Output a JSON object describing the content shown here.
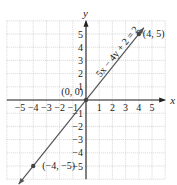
{
  "chart_data": {
    "type": "line",
    "title": "",
    "xlabel": "x",
    "ylabel": "y",
    "xlim": [
      -6,
      6
    ],
    "ylim": [
      -6,
      6
    ],
    "grid": true,
    "x_ticks": [
      -5,
      -4,
      -3,
      -2,
      -1,
      1,
      2,
      3,
      4,
      5
    ],
    "y_ticks": [
      -5,
      -4,
      -3,
      -2,
      -1,
      1,
      2,
      3,
      4,
      5
    ],
    "x_tick_labels": [
      "−5",
      "−4",
      "−3",
      "−2",
      "−1",
      "1",
      "2",
      "3",
      "4",
      "5"
    ],
    "y_tick_labels": [
      "−5",
      "−4",
      "−3",
      "−2",
      "−1",
      "1",
      "2",
      "3",
      "4",
      "5"
    ],
    "series": [
      {
        "name": "5x − 4y + 2 = 2",
        "equation": "5x − 4y + 2 = 2",
        "x": [
          -4,
          0,
          4
        ],
        "y": [
          -5,
          0,
          5
        ]
      }
    ],
    "points": [
      {
        "x": 0,
        "y": 0,
        "label": "(0, 0)"
      },
      {
        "x": 4,
        "y": 5,
        "label": "(4, 5)"
      },
      {
        "x": -4,
        "y": -5,
        "label": "(−4, −5)"
      }
    ],
    "line_color": "#555555",
    "grid_color": "#bbbbbb"
  }
}
